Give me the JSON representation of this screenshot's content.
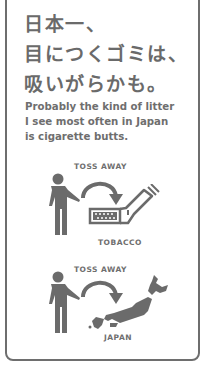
{
  "headline": {
    "line1": "日本一、",
    "line2": "目につくゴミは、",
    "line3": "吸いがらかも。"
  },
  "subtitle": {
    "line1": "Probably the kind of litter",
    "line2": "I see most often in Japan",
    "line3": "is cigarette butts."
  },
  "panels": [
    {
      "action_label": "TOSS AWAY",
      "target_label": "TOBACCO",
      "icons": [
        "person-icon",
        "curved-arrow-icon",
        "cigarette-butt-icon"
      ]
    },
    {
      "action_label": "TOSS AWAY",
      "target_label": "JAPAN",
      "icons": [
        "person-icon",
        "curved-arrow-icon",
        "japan-map-icon"
      ]
    }
  ],
  "colors": {
    "ink": "#6b6b6b",
    "border": "#6e6e6e",
    "background": "#ffffff"
  }
}
